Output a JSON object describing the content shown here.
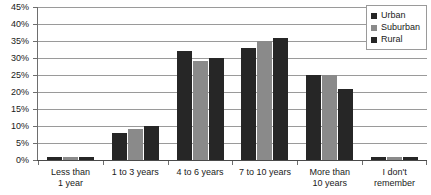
{
  "chart_data": {
    "type": "bar",
    "title": "",
    "xlabel": "",
    "ylabel": "",
    "ylim": [
      0,
      45
    ],
    "ytick_step": 5,
    "grid": true,
    "legend_position": "top-right",
    "categories": [
      "Less than 1 year",
      "1 to 3 years",
      "4 to 6 years",
      "7 to 10 years",
      "More than 10 years",
      "I don't remember"
    ],
    "category_lines": [
      [
        "Less than",
        "1 year"
      ],
      [
        "1 to 3 years"
      ],
      [
        "4 to 6 years"
      ],
      [
        "7 to 10 years"
      ],
      [
        "More than",
        "10 years"
      ],
      [
        "I don't",
        "remember"
      ]
    ],
    "ytick_labels": [
      "45%",
      "40%",
      "35%",
      "30%",
      "25%",
      "20%",
      "15%",
      "10%",
      "5%",
      "0%"
    ],
    "series": [
      {
        "name": "Urban",
        "color": "#262626",
        "values": [
          1,
          8,
          32,
          33,
          25,
          1
        ]
      },
      {
        "name": "Suburban",
        "color": "#8a8a8a",
        "values": [
          1,
          9,
          29,
          35,
          25,
          1
        ]
      },
      {
        "name": "Rural",
        "color": "#262626",
        "values": [
          1,
          10,
          30,
          36,
          21,
          1
        ]
      }
    ]
  },
  "legend": {
    "items": [
      {
        "label": "Urban"
      },
      {
        "label": "Suburban"
      },
      {
        "label": "Rural"
      }
    ]
  }
}
